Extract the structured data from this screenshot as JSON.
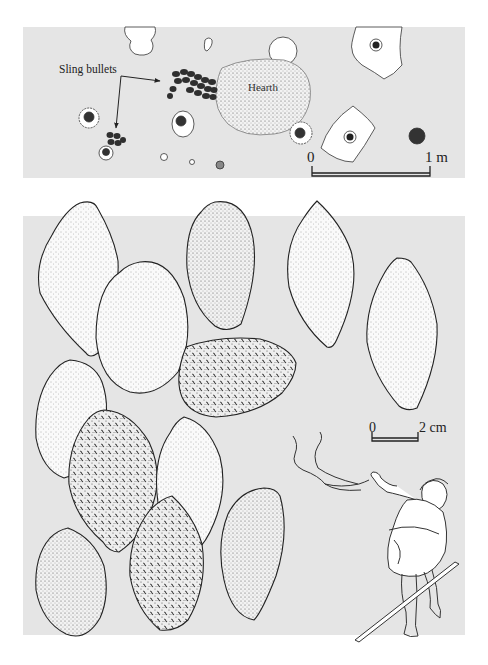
{
  "figure": {
    "plan_panel": {
      "annotations": {
        "sling_bullets": "Sling bullets",
        "hearth": "Hearth"
      },
      "scale_bar": {
        "start_label": "0",
        "end_label": "1 m"
      }
    },
    "bullets_panel": {
      "bullet_count": 12,
      "scale_bar": {
        "start_label": "0",
        "end_label": "2 cm"
      },
      "illustration": "slinger-figure"
    },
    "colors": {
      "panel_background": "#e5e5e5",
      "page_background": "#ffffff",
      "ink": "#222222",
      "bullet_fill": "#f7f7f7",
      "cluster_fill": "#3a3a3a"
    }
  }
}
